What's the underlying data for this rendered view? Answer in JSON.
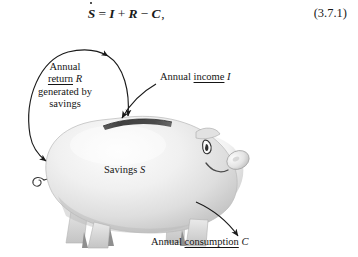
{
  "figure": {
    "kind": "piggy-bank-savings-flow-diagram",
    "background_color": "#ffffff",
    "ink_color": "#151515"
  },
  "equation": {
    "lhs_variable": "S",
    "lhs_accent": "dot",
    "equals": "=",
    "term_1": "I",
    "op_1": "+",
    "term_2": "R",
    "op_2": "−",
    "term_3": "C",
    "trailing_punctuation": ",",
    "number": "(3.7.1)"
  },
  "annotations": {
    "return": {
      "line_1": "Annual",
      "underlined_word": "return",
      "symbol": "R",
      "line_3": "generated by",
      "line_4": "savings"
    },
    "income": {
      "prefix": "Annual",
      "underlined_word": "income",
      "symbol": "I"
    },
    "consumption": {
      "prefix": "Annual",
      "underlined_word": "consumption",
      "symbol": "C"
    },
    "savings": {
      "prefix": "Savings",
      "symbol": "S"
    }
  },
  "illustration": {
    "subject": "piggy-bank",
    "facing": "right",
    "body_color": "#e9e9e9",
    "body_highlight_color": "#fbfbfb",
    "body_shadow_color": "#c6c6c6",
    "slot_color": "#4a4a4a",
    "outline_color": "#9a9a9a",
    "parts": [
      "body",
      "coin-slot",
      "ear",
      "snout",
      "eye",
      "mouth",
      "tail",
      "front-legs",
      "hind-legs"
    ]
  },
  "arrows": {
    "income_arrow": {
      "from": "annual-income-label",
      "to": "coin-slot",
      "direction": "down-left"
    },
    "return_arrow": {
      "from": "coin-slot",
      "to": "savings-body",
      "direction": "counter-clockwise-loop"
    },
    "consumption_arrow": {
      "from": "savings-body",
      "to": "annual-consumption-label",
      "direction": "down-right"
    }
  }
}
